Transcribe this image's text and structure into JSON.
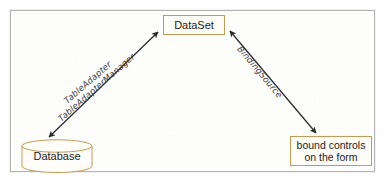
{
  "diagram": {
    "frame": {
      "border_color": "#b3b3b3",
      "background": "#fdfdfc"
    },
    "node_border_color": "#c79a52",
    "line_color": "#2b2b2b",
    "nodes": {
      "dataset": {
        "label": "DataSet",
        "shape": "rectangle"
      },
      "database": {
        "label": "Database",
        "shape": "cylinder"
      },
      "bound_controls": {
        "label_line1": "bound controls",
        "label_line2": "on the form",
        "shape": "rectangle"
      }
    },
    "edges": {
      "left": {
        "from": "database",
        "to": "dataset",
        "arrow": "double",
        "label_top": "TableAdapter",
        "label_bottom": "TableAdapterManager"
      },
      "right": {
        "from": "dataset",
        "to": "bound_controls",
        "arrow": "double",
        "label": "BindingSource"
      }
    }
  }
}
